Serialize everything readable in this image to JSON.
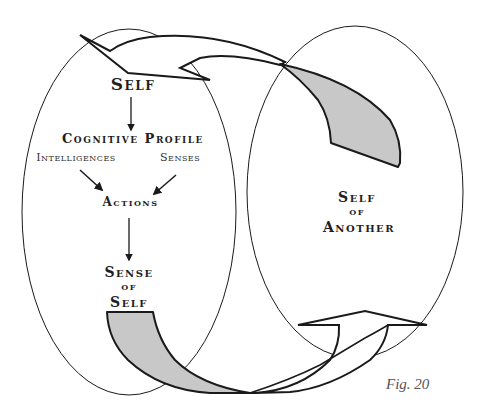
{
  "figure": {
    "caption": "Fig. 20",
    "colors": {
      "stroke": "#1a1a1a",
      "fill_gray": "#c8c8c8",
      "background": "#ffffff"
    }
  },
  "left_ellipse": {
    "labels": {
      "self": "Self",
      "cognitive_profile": "Cognitive Profile",
      "intelligences": "Intelligences",
      "senses": "Senses",
      "actions": "Actions",
      "sense_of_self_line1": "Sense",
      "sense_of_self_line2": "of",
      "sense_of_self_line3": "Self"
    }
  },
  "right_ellipse": {
    "labels": {
      "line1": "Self",
      "line2": "of",
      "line3": "Another"
    }
  },
  "flow": [
    {
      "from": "Self",
      "to": "Cognitive Profile"
    },
    {
      "from": "Intelligences",
      "to": "Actions"
    },
    {
      "from": "Senses",
      "to": "Actions"
    },
    {
      "from": "Actions",
      "to": "Sense of Self"
    },
    {
      "from": "Sense of Self",
      "to": "Self of Another",
      "via": "bottom curved arrow"
    },
    {
      "from": "Self of Another",
      "to": "Self",
      "via": "top curved arrow"
    }
  ]
}
